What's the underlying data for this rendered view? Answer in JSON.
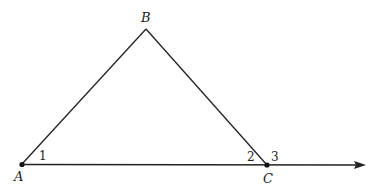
{
  "diagram": {
    "type": "triangle-exterior-angle",
    "points": {
      "A": {
        "label": "A",
        "x": 22,
        "y": 164
      },
      "B": {
        "label": "B",
        "x": 146,
        "y": 29
      },
      "C": {
        "label": "C",
        "x": 267,
        "y": 165
      }
    },
    "ray_end": {
      "x": 366,
      "y": 165
    },
    "angles": [
      {
        "label": "1",
        "at": "A"
      },
      {
        "label": "2",
        "at": "C",
        "side": "interior"
      },
      {
        "label": "3",
        "at": "C",
        "side": "exterior"
      }
    ],
    "colors": {
      "stroke": "#222222",
      "background": "#ffffff"
    }
  }
}
